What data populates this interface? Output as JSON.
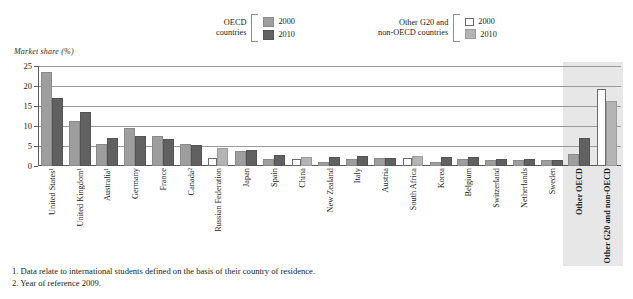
{
  "legend": {
    "groups": [
      {
        "title": "OECD\ncountries",
        "items": [
          {
            "label": "2000",
            "swatch": "oecd2000",
            "color": "#9e9e9e"
          },
          {
            "label": "2010",
            "swatch": "oecd2010",
            "color": "#616161"
          }
        ]
      },
      {
        "title": "Other G20 and\nnon-OECD countries",
        "items": [
          {
            "label": "2000",
            "swatch": "other2000",
            "color": "#ffffff"
          },
          {
            "label": "2010",
            "swatch": "other2010",
            "color": "#b4b4b4"
          }
        ]
      }
    ]
  },
  "axis": {
    "y_title": "Market share (%)",
    "ticks": [
      "25",
      "20",
      "15",
      "10",
      "5",
      "0"
    ]
  },
  "footnotes": [
    "1. Data relate to international students defined on the basis of their country of residence.",
    "2. Year of reference 2009."
  ],
  "chart_data": {
    "type": "bar",
    "title": "",
    "xlabel": "",
    "ylabel": "Market share (%)",
    "ylim": [
      0,
      25
    ],
    "yticks": [
      0,
      5,
      10,
      15,
      20,
      25
    ],
    "grid": true,
    "legend_position": "top",
    "categories": [
      "United States¹",
      "United Kingdom¹",
      "Australia¹",
      "Germany",
      "France",
      "Canada²",
      "Russian Federation",
      "Japan",
      "Spain",
      "China",
      "New Zealand",
      "Italy",
      "Austria",
      "South Africa",
      "Korea",
      "Belgium",
      "Switzerland",
      "Netherlands",
      "Sweden",
      "Other OECD",
      "Other G20 and non-OECD"
    ],
    "category_groups": [
      "oecd",
      "oecd",
      "oecd",
      "oecd",
      "oecd",
      "oecd",
      "other",
      "oecd",
      "oecd",
      "other",
      "oecd",
      "oecd",
      "oecd",
      "other",
      "oecd",
      "oecd",
      "oecd",
      "oecd",
      "oecd",
      "oecd",
      "other"
    ],
    "highlighted": [
      "Other OECD",
      "Other G20 and non-OECD"
    ],
    "series": [
      {
        "name": "2000",
        "values": [
          23.0,
          10.8,
          5.0,
          9.0,
          7.0,
          5.0,
          2.0,
          3.2,
          1.3,
          1.8,
          0.6,
          1.2,
          1.5,
          2.0,
          0.4,
          1.2,
          1.1,
          1.1,
          0.9,
          2.5,
          19.2
        ]
      },
      {
        "name": "2010",
        "values": [
          16.6,
          13.0,
          6.6,
          7.0,
          6.3,
          4.7,
          4.0,
          3.4,
          2.2,
          1.7,
          1.8,
          1.9,
          1.6,
          2.0,
          1.7,
          1.8,
          1.2,
          1.2,
          1.1,
          6.6,
          15.8
        ]
      }
    ]
  }
}
